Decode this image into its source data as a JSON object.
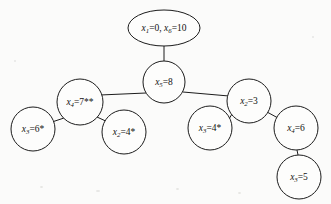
{
  "figure": {
    "type": "search-tree-diagram",
    "background_color": "#fbfbfa",
    "stroke_color": "#1c1c1c",
    "width": 331,
    "height": 204
  },
  "nodes": [
    {
      "id": "root",
      "shape": "ellipse",
      "cx": 164,
      "cy": 28,
      "rx": 36,
      "ry": 18,
      "var1": "x",
      "sub1": "1",
      "eq1": "=0, ",
      "var2": "x",
      "sub2": "6",
      "eq2": "=10",
      "text": "x1=0, x6=10",
      "marks": ""
    },
    {
      "id": "n5",
      "shape": "circle",
      "cx": 164,
      "cy": 82,
      "rx": 21,
      "ry": 21,
      "var1": "x",
      "sub1": "5",
      "eq1": "=8",
      "var2": "",
      "sub2": "",
      "eq2": "",
      "text": "x5=8",
      "marks": ""
    },
    {
      "id": "n4a",
      "shape": "circle",
      "cx": 80,
      "cy": 102,
      "rx": 23,
      "ry": 23,
      "var1": "x",
      "sub1": "4",
      "eq1": "=7**",
      "var2": "",
      "sub2": "",
      "eq2": "",
      "text": "x4=7**",
      "marks": "**"
    },
    {
      "id": "n3a",
      "shape": "circle",
      "cx": 33,
      "cy": 129,
      "rx": 22,
      "ry": 22,
      "var1": "x",
      "sub1": "3",
      "eq1": "=6*",
      "var2": "",
      "sub2": "",
      "eq2": "",
      "text": "x3=6*",
      "marks": "*"
    },
    {
      "id": "n2a",
      "shape": "circle",
      "cx": 124,
      "cy": 132,
      "rx": 22,
      "ry": 22,
      "var1": "x",
      "sub1": "2",
      "eq1": "=4*",
      "var2": "",
      "sub2": "",
      "eq2": "",
      "text": "x2=4*",
      "marks": "*"
    },
    {
      "id": "n2b",
      "shape": "circle",
      "cx": 249,
      "cy": 101,
      "rx": 22,
      "ry": 22,
      "var1": "x",
      "sub1": "2",
      "eq1": "=3",
      "var2": "",
      "sub2": "",
      "eq2": "",
      "text": "x2=3",
      "marks": ""
    },
    {
      "id": "n3b",
      "shape": "circle",
      "cx": 210,
      "cy": 128,
      "rx": 22,
      "ry": 22,
      "var1": "x",
      "sub1": "3",
      "eq1": "=4*",
      "var2": "",
      "sub2": "",
      "eq2": "",
      "text": "x3=4*",
      "marks": "*"
    },
    {
      "id": "n4b",
      "shape": "circle",
      "cx": 296,
      "cy": 128,
      "rx": 22,
      "ry": 22,
      "var1": "x",
      "sub1": "4",
      "eq1": "=6",
      "var2": "",
      "sub2": "",
      "eq2": "",
      "text": "x4=6",
      "marks": ""
    },
    {
      "id": "n3c",
      "shape": "circle",
      "cx": 299,
      "cy": 177,
      "rx": 22,
      "ry": 22,
      "var1": "x",
      "sub1": "3",
      "eq1": "=5",
      "var2": "",
      "sub2": "",
      "eq2": "",
      "text": "x3=5",
      "marks": ""
    }
  ],
  "edges": [
    {
      "id": "edge-root-n5",
      "from": "root",
      "to": "n5",
      "x1": 164,
      "y1": 46,
      "x2": 164,
      "y2": 61
    },
    {
      "id": "edge-n5-n4a",
      "from": "n5",
      "to": "n4a",
      "x1": 146,
      "y1": 93,
      "x2": 100,
      "y2": 95
    },
    {
      "id": "edge-n5-n2b",
      "from": "n5",
      "to": "n2b",
      "x1": 183,
      "y1": 92,
      "x2": 229,
      "y2": 96
    },
    {
      "id": "edge-n4a-n3a",
      "from": "n4a",
      "to": "n3a",
      "x1": 64,
      "y1": 118,
      "x2": 49,
      "y2": 123
    },
    {
      "id": "edge-n4a-n2a",
      "from": "n4a",
      "to": "n2a",
      "x1": 97,
      "y1": 117,
      "x2": 110,
      "y2": 123
    },
    {
      "id": "edge-n2b-n3b",
      "from": "n2b",
      "to": "n3b",
      "x1": 232,
      "y1": 114,
      "x2": 229,
      "y2": 119
    },
    {
      "id": "edge-n2b-n4b",
      "from": "n2b",
      "to": "n4b",
      "x1": 267,
      "y1": 112,
      "x2": 278,
      "y2": 118
    },
    {
      "id": "edge-n4b-n3c",
      "from": "n4b",
      "to": "n3c",
      "x1": 297,
      "y1": 150,
      "x2": 298,
      "y2": 155
    }
  ]
}
